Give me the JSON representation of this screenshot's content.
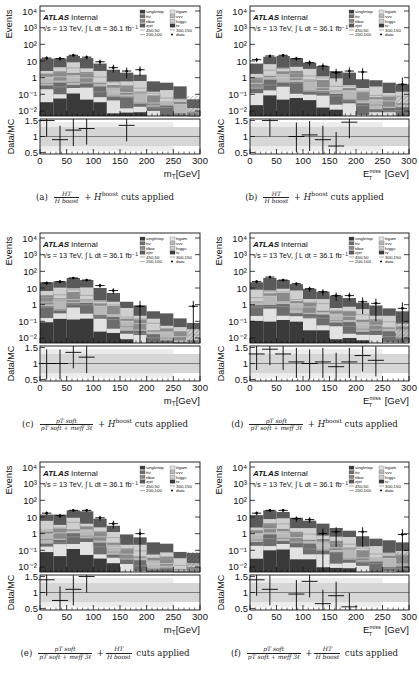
{
  "figure": {
    "common": {
      "experiment": "ATLAS",
      "status": "Internal",
      "energy_label": "√s = 13 TeV, ∫ L dt = 36.1 fb⁻¹",
      "y_label_main": "Events",
      "y_label_ratio": "Data/MC",
      "y_ticks_main": [
        "10⁴",
        "10³",
        "10²",
        "10",
        "1",
        "10⁻¹",
        "10⁻²"
      ],
      "y_ticks_ratio": [
        "1.5",
        "1",
        "0.5"
      ],
      "x_ticks": [
        "0",
        "50",
        "100",
        "150",
        "200",
        "250",
        "300"
      ],
      "legend": [
        "singletop",
        "ttgam",
        "ttv",
        "vvv",
        "ttbar",
        "higgs",
        "zjet",
        "tv",
        "450,50",
        "300,150",
        "200,100",
        "data"
      ]
    },
    "panels": [
      {
        "id": "a",
        "caption_label": "(a)",
        "caption_frac_num": "H_T",
        "caption_frac_den": "H^boost",
        "caption_plus": "+ H",
        "caption_sup": "boost",
        "caption_tail": "cuts applied",
        "xlabel": "m_T[GeV]"
      },
      {
        "id": "b",
        "caption_label": "(b)",
        "caption_frac_num": "H_T",
        "caption_frac_den": "H^boost",
        "caption_plus": "+ H",
        "caption_sup": "boost",
        "caption_tail": "cuts applied",
        "xlabel": "E_T^miss [GeV]"
      },
      {
        "id": "c",
        "caption_label": "(c)",
        "caption_frac_num": "p_T^soft",
        "caption_frac_den": "p_T^soft + m_eff^3ℓ",
        "caption_plus": "+ H",
        "caption_sup": "boost",
        "caption_tail": "cuts applied",
        "xlabel": "m_T[GeV]"
      },
      {
        "id": "d",
        "caption_label": "(d)",
        "caption_frac_num": "p_T^soft",
        "caption_frac_den": "p_T^soft + m_eff^3ℓ",
        "caption_plus": "+ H",
        "caption_sup": "boost",
        "caption_tail": "cuts applied",
        "xlabel": "E_T^miss [GeV]"
      },
      {
        "id": "e",
        "caption_label": "(e)",
        "caption_frac_num": "p_T^soft",
        "caption_frac_den": "p_T^soft + m_eff^3ℓ",
        "caption_plus": "+",
        "caption_sup": "",
        "caption_tail": "cuts applied",
        "caption_frac2_num": "H_T",
        "caption_frac2_den": "H^boost",
        "xlabel": "m_T[GeV]"
      },
      {
        "id": "f",
        "caption_label": "(f)",
        "caption_frac_num": "p_T^soft",
        "caption_frac_den": "p_T^soft + m_eff^3ℓ",
        "caption_plus": "+",
        "caption_sup": "",
        "caption_tail": "cuts applied",
        "caption_frac2_num": "H_T",
        "caption_frac2_den": "H^boost",
        "xlabel": "E_T^miss [GeV]"
      }
    ]
  },
  "chart_data": [
    {
      "panel": "a",
      "type": "bar",
      "stacked": true,
      "log_y": true,
      "title": "",
      "xlabel": "m_T [GeV]",
      "ylabel": "Events",
      "xlim": [
        0,
        300
      ],
      "ylim": [
        0.005,
        20000
      ],
      "bin_edges": [
        0,
        25,
        50,
        75,
        100,
        125,
        150,
        175,
        200,
        225,
        250,
        275,
        300
      ],
      "stack_total": [
        14,
        14,
        20,
        15,
        7,
        3,
        2,
        1.5,
        0.6,
        0.5,
        0.3,
        0.05
      ],
      "data": [
        15,
        14,
        22,
        17,
        9,
        4,
        2.5,
        3,
        0,
        0,
        0,
        0
      ],
      "ratio": {
        "x": [
          12.5,
          37.5,
          62.5,
          87.5,
          162.5
        ],
        "y": [
          1.5,
          0.9,
          1.2,
          1.25,
          1.35
        ],
        "ylim": [
          0.5,
          1.5
        ]
      }
    },
    {
      "panel": "b",
      "type": "bar",
      "stacked": true,
      "log_y": true,
      "title": "",
      "xlabel": "E_T^miss [GeV]",
      "ylabel": "Events",
      "xlim": [
        0,
        300
      ],
      "ylim": [
        0.005,
        20000
      ],
      "bin_edges": [
        0,
        25,
        50,
        75,
        100,
        125,
        150,
        175,
        200,
        225,
        250,
        275,
        300
      ],
      "stack_total": [
        7,
        18,
        20,
        15,
        8,
        5,
        2.5,
        2,
        0.8,
        0.7,
        0.5,
        0.4
      ],
      "data": [
        12,
        20,
        22,
        14,
        8,
        5,
        2,
        2.5,
        2.2,
        0,
        0,
        0.4
      ],
      "ratio": {
        "x": [
          37.5,
          87.5,
          112.5,
          137.5,
          162.5,
          187.5
        ],
        "y": [
          1.5,
          1.0,
          1.05,
          0.9,
          0.7,
          1.45
        ],
        "ylim": [
          0.5,
          1.5
        ]
      }
    },
    {
      "panel": "c",
      "type": "bar",
      "stacked": true,
      "log_y": true,
      "title": "",
      "xlabel": "m_T [GeV]",
      "ylabel": "Events",
      "xlim": [
        0,
        300
      ],
      "ylim": [
        0.005,
        20000
      ],
      "bin_edges": [
        0,
        25,
        50,
        75,
        100,
        125,
        150,
        175,
        200,
        225,
        250,
        275,
        300
      ],
      "stack_total": [
        22,
        25,
        40,
        30,
        10,
        5,
        1.5,
        0.9,
        0.4,
        0.3,
        0.15,
        0.08
      ],
      "data": [
        20,
        24,
        40,
        30,
        14,
        7,
        0,
        0.8,
        0,
        0,
        0,
        0.8
      ],
      "ratio": {
        "x": [
          12.5,
          37.5,
          62.5,
          87.5
        ],
        "y": [
          1.0,
          1.0,
          1.35,
          1.2
        ],
        "ylim": [
          0.5,
          1.5
        ]
      }
    },
    {
      "panel": "d",
      "type": "bar",
      "stacked": true,
      "log_y": true,
      "title": "",
      "xlabel": "E_T^miss [GeV]",
      "ylabel": "Events",
      "xlim": [
        0,
        300
      ],
      "ylim": [
        0.005,
        20000
      ],
      "bin_edges": [
        0,
        25,
        50,
        75,
        100,
        125,
        150,
        175,
        200,
        225,
        250,
        275,
        300
      ],
      "stack_total": [
        22,
        40,
        30,
        17,
        9,
        6,
        3.5,
        2.5,
        1.3,
        0.9,
        0.6,
        0.4
      ],
      "data": [
        24,
        45,
        30,
        18,
        9,
        6,
        3.5,
        3.5,
        1.5,
        1.2,
        0,
        0.6
      ],
      "ratio": {
        "x": [
          12.5,
          37.5,
          62.5,
          87.5,
          112.5,
          137.5,
          162.5,
          187.5,
          212.5,
          237.5
        ],
        "y": [
          1.3,
          1.45,
          1.3,
          1.05,
          1.0,
          1.05,
          0.9,
          1.05,
          1.25,
          1.1
        ],
        "ylim": [
          0.5,
          1.5
        ]
      }
    },
    {
      "panel": "e",
      "type": "bar",
      "stacked": true,
      "log_y": true,
      "title": "",
      "xlabel": "m_T [GeV]",
      "ylabel": "Events",
      "xlim": [
        0,
        300
      ],
      "ylim": [
        0.005,
        20000
      ],
      "bin_edges": [
        0,
        25,
        50,
        75,
        100,
        125,
        150,
        175,
        200,
        225,
        250,
        275,
        300
      ],
      "stack_total": [
        14,
        14,
        25,
        22,
        8,
        3,
        0.9,
        0.6,
        0.3,
        0.25,
        0.08,
        0.07
      ],
      "data": [
        17,
        12,
        25,
        25,
        9,
        4,
        0,
        1,
        0,
        0,
        0,
        0
      ],
      "ratio": {
        "x": [
          12.5,
          37.5,
          62.5,
          87.5
        ],
        "y": [
          1.4,
          0.75,
          1.1,
          1.5
        ],
        "ylim": [
          0.5,
          1.5
        ]
      }
    },
    {
      "panel": "f",
      "type": "bar",
      "stacked": true,
      "log_y": true,
      "title": "",
      "xlabel": "E_T^miss [GeV]",
      "ylabel": "Events",
      "xlim": [
        0,
        300
      ],
      "ylim": [
        0.005,
        20000
      ],
      "bin_edges": [
        0,
        25,
        50,
        75,
        100,
        125,
        150,
        175,
        200,
        225,
        250,
        275,
        300
      ],
      "stack_total": [
        13,
        25,
        20,
        9,
        6,
        4,
        2.2,
        1.5,
        0.7,
        0.5,
        0.4,
        0.3
      ],
      "data": [
        17,
        25,
        25,
        8,
        7,
        1,
        1.3,
        0,
        1.3,
        0,
        0,
        0.9
      ],
      "ratio": {
        "x": [
          12.5,
          37.5,
          87.5,
          112.5,
          137.5,
          162.5,
          187.5
        ],
        "y": [
          1.4,
          1.1,
          0.95,
          1.35,
          0.65,
          0.9,
          0.55
        ],
        "ylim": [
          0.5,
          1.5
        ]
      }
    }
  ],
  "colors": {
    "stack_layers": [
      "#3a3a3a",
      "#e2e2e2",
      "#6d6d6d",
      "#b8b8b8",
      "#8a8a8a",
      "#cfcfcf",
      "#5a5a5a"
    ],
    "band": "#d6d6d6",
    "axis": "#111111",
    "signal_line": "#9a9a9a"
  }
}
